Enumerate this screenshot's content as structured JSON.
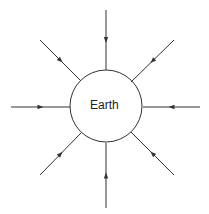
{
  "diagram": {
    "center_label": "Earth",
    "circle": {
      "cx": 106,
      "cy": 106,
      "r": 36
    },
    "stroke_color": "#333333",
    "arrows": [
      {
        "name": "north",
        "x1": 106,
        "y1": 10,
        "x2": 106,
        "y2": 70
      },
      {
        "name": "northeast",
        "x1": 174,
        "y1": 40,
        "x2": 131,
        "y2": 82
      },
      {
        "name": "east",
        "x1": 200,
        "y1": 107,
        "x2": 143,
        "y2": 107
      },
      {
        "name": "southeast",
        "x1": 174,
        "y1": 175,
        "x2": 131,
        "y2": 132
      },
      {
        "name": "south",
        "x1": 106,
        "y1": 208,
        "x2": 106,
        "y2": 143
      },
      {
        "name": "southwest",
        "x1": 40,
        "y1": 175,
        "x2": 81,
        "y2": 133
      },
      {
        "name": "west",
        "x1": 11,
        "y1": 107,
        "x2": 70,
        "y2": 107
      },
      {
        "name": "northwest",
        "x1": 40,
        "y1": 40,
        "x2": 81,
        "y2": 81
      }
    ]
  }
}
